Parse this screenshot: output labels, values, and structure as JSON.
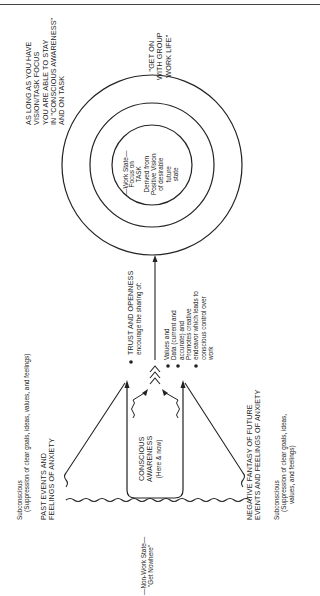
{
  "diagram": {
    "orientation": "rotated-90-ccw",
    "work_state": {
      "label": "—Work State—",
      "core": [
        "Focus on",
        "TASK",
        "Derived from",
        "Positive Vision",
        "of desirable",
        "future",
        "state"
      ]
    },
    "awareness_note": [
      "AS LONG AS YOU HAVE",
      "VISION/TASK FOCUS",
      "YOU ARE ABLE TO STAY",
      "IN \"CONSCIOUS AWARENESS\"",
      "AND ON TASK"
    ],
    "group_note": [
      "\"GET ON",
      "WITH GROUP",
      "WORK LIFE\""
    ],
    "trust": {
      "title": "TRUST AND OPENNESS",
      "subtitle": "encourage the sharing of:",
      "items": [
        [
          "Values and"
        ],
        [
          "Data (current and",
          "accurate) and"
        ],
        [
          "Promotes creative",
          "endeavor which leads to",
          "conscious control over",
          "work"
        ]
      ]
    },
    "conscious": [
      "CONSCIOUS",
      "AWARENESS",
      "(Here & now)"
    ],
    "past": {
      "subconscious": "Subconscious",
      "suppression": "(Suppression of clear goals, ideas, values, and feelings)",
      "title": [
        "PAST EVENTS AND",
        "FEELINGS OF ANXIETY"
      ]
    },
    "future": {
      "title": [
        "NEGATIVE FANTASY OF FUTURE",
        "EVENTS AND FEELINGS OF ANXIETY"
      ],
      "subconscious": "Subconscious",
      "suppression": [
        "(Suppression of clear goals, ideas,",
        "values, and feelings)"
      ]
    },
    "non_work": [
      "—Non-Work State—",
      "\"Get Nowhere\""
    ]
  }
}
